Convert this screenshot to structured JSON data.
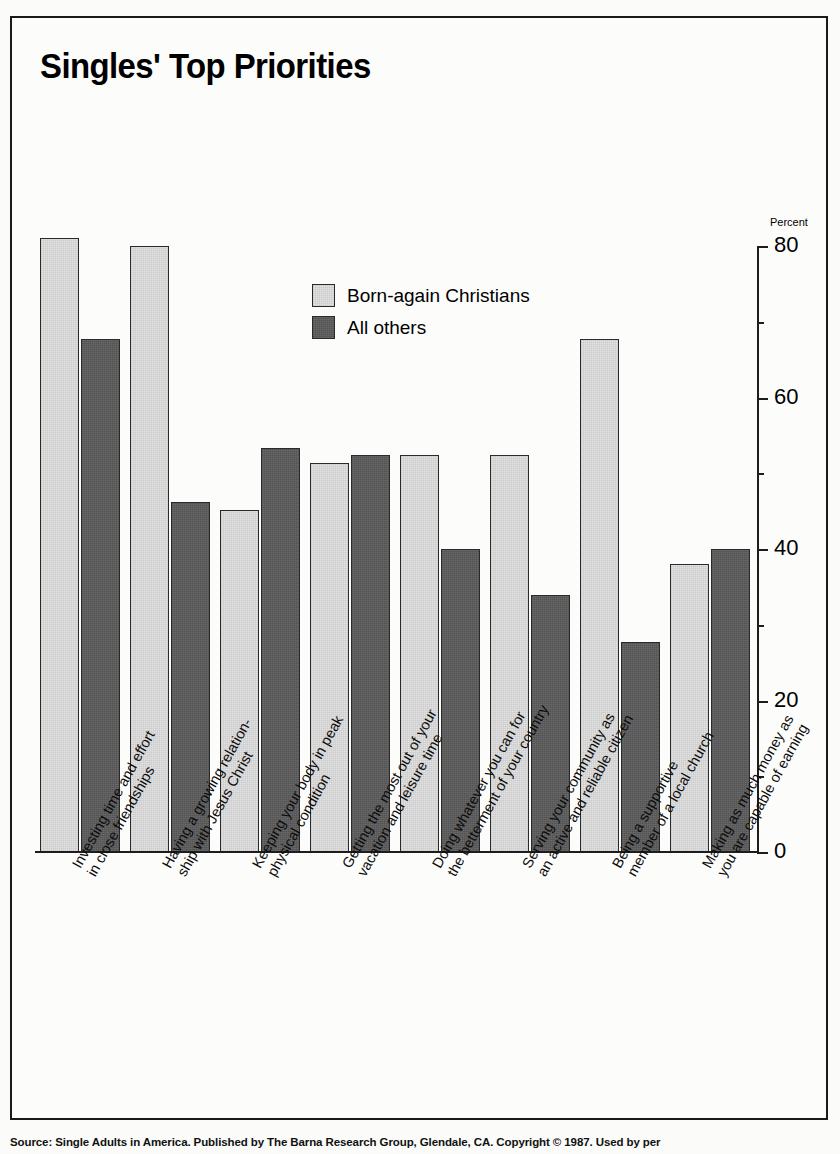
{
  "chart_data": {
    "type": "bar",
    "title": "Singles' Top Priorities",
    "xlabel": "",
    "ylabel": "Percent",
    "ylim": [
      0,
      80
    ],
    "yticks": [
      0,
      20,
      40,
      60,
      80
    ],
    "yticks_minor": [
      10,
      30,
      50,
      70
    ],
    "grid": false,
    "legend_position": "upper-center",
    "categories": [
      "Investing time and effort in close friendships",
      "Having a growing relation- ship with Jesus Christ",
      "Keeping your body in peak physical condition",
      "Getting the most out of your vacation and leisure time",
      "Doing whatever you can for the betterment of your country",
      "Serving your community as an active and reliable citizen",
      "Being a supportive member of a local church",
      "Making as much money as you are capable of earning"
    ],
    "category_lines": [
      [
        "Investing time and effort",
        "in close friendships"
      ],
      [
        "Having a growing relation-",
        "ship with Jesus Christ"
      ],
      [
        "Keeping your body in peak",
        "physical condition"
      ],
      [
        "Getting the most out of your",
        "vacation and leisure time"
      ],
      [
        "Doing whatever you can for",
        "the betterment of your country"
      ],
      [
        "Serving your community as",
        "an active and reliable citizen"
      ],
      [
        "Being a supportive",
        "member of a local church"
      ],
      [
        "Making as much money as",
        "you are capable of earning"
      ]
    ],
    "series": [
      {
        "name": "Born-again Christians",
        "color": "#e2e2e2",
        "values": [
          79,
          78,
          44,
          50,
          51,
          51,
          66,
          37
        ]
      },
      {
        "name": "All others",
        "color": "#5c5c5c",
        "values": [
          66,
          45,
          52,
          51,
          39,
          33,
          27,
          39
        ]
      }
    ]
  },
  "legend": {
    "items": [
      {
        "label": "Born-again Christians",
        "swatch": "series-light"
      },
      {
        "label": "All others",
        "swatch": "series-dark"
      }
    ]
  },
  "axis": {
    "y_title": "Percent",
    "labels": [
      "80",
      "60",
      "40",
      "20",
      "0"
    ]
  },
  "footer": {
    "source": "Source: Single Adults in America. Published by The Barna Research Group, Glendale, CA. Copyright © 1987. Used by per"
  }
}
